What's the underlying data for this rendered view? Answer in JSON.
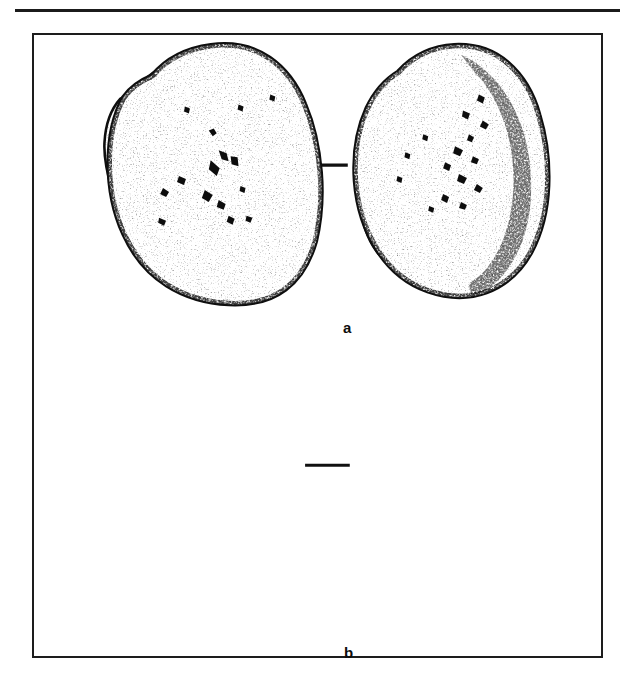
{
  "page": {
    "background_color": "#ffffff",
    "ink_color": "#111111",
    "width": 633,
    "height": 688
  },
  "top_rule": {
    "name": "header-rule",
    "color": "#1b1b1b",
    "x": 15,
    "y": 9,
    "width": 605,
    "thickness": 3
  },
  "figure": {
    "frame": {
      "x": 32,
      "y": 33,
      "width": 571,
      "height": 625,
      "border_color": "#1d1d1d",
      "border_width": 2
    },
    "panels": [
      {
        "id": "a",
        "label": "a",
        "label_x": 309,
        "label_y": 285,
        "items": [
          {
            "name": "flaked-stone-core-drawing",
            "style": "stippled line drawing with flake scars",
            "x": 133,
            "y": 63,
            "width": 170,
            "height": 209
          },
          {
            "name": "cross-section-profile",
            "style": "diagonal hatched section",
            "hatch_angle_deg": 45,
            "x": 348,
            "y": 65,
            "width": 145,
            "height": 207
          }
        ],
        "connector": {
          "name": "section-connector-line",
          "x1": 303,
          "y1": 164,
          "x2": 348,
          "y2": 164,
          "thickness": 3
        }
      },
      {
        "id": "b",
        "label": "b",
        "label_x": 310,
        "label_y": 610,
        "items": [
          {
            "name": "cobble-hammerstone-drawing-left",
            "style": "dense stipple shading, shaded right and lower edges",
            "x": 98,
            "y": 343,
            "width": 207,
            "height": 257
          },
          {
            "name": "cobble-hammerstone-drawing-right",
            "style": "dense stipple shading, shaded right and lower edges",
            "x": 350,
            "y": 348,
            "width": 190,
            "height": 260
          }
        ],
        "connector": {
          "name": "view-connector-line",
          "x1": 305,
          "y1": 466,
          "x2": 350,
          "y2": 466,
          "thickness": 3
        }
      }
    ]
  }
}
